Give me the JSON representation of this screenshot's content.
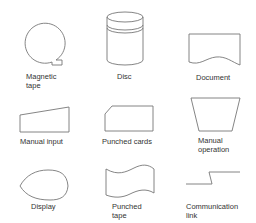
{
  "diagram": {
    "type": "flowchart-symbol-legend",
    "stroke_color": "#777777",
    "symbols": [
      {
        "id": "magnetic-tape",
        "label": "Magnetic\ntape"
      },
      {
        "id": "disc",
        "label": "Disc"
      },
      {
        "id": "document",
        "label": "Document"
      },
      {
        "id": "manual-input",
        "label": "Manual input"
      },
      {
        "id": "punched-cards",
        "label": "Punched cards"
      },
      {
        "id": "manual-operation",
        "label": "Manual\noperation"
      },
      {
        "id": "display",
        "label": "Display"
      },
      {
        "id": "punched-tape",
        "label": "Punched\ntape"
      },
      {
        "id": "communication-link",
        "label": "Communication\nlink"
      }
    ]
  }
}
